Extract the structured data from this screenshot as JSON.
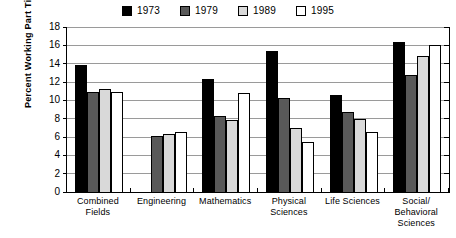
{
  "chart_data": {
    "type": "bar",
    "title": "",
    "xlabel": "",
    "ylabel": "Percent Working Part Time",
    "ylim": [
      0,
      18
    ],
    "ytick_step": 2,
    "yticks": [
      "0",
      "2",
      "4",
      "6",
      "8",
      "10",
      "12",
      "14",
      "16",
      "18"
    ],
    "grid": true,
    "legend_position": "top-center",
    "categories": [
      "Combined Fields",
      "Engineering",
      "Mathematics",
      "Physical Sciences",
      "Life Sciences",
      "Social/ Behavioral Sciences"
    ],
    "category_lines": [
      [
        "Combined",
        "Fields"
      ],
      [
        "Engineering"
      ],
      [
        "Mathematics"
      ],
      [
        "Physical",
        "Sciences"
      ],
      [
        "Life Sciences"
      ],
      [
        "Social/",
        "Behavioral",
        "Sciences"
      ]
    ],
    "series": [
      {
        "name": "1973",
        "color": "#000000",
        "values": [
          13.9,
          null,
          12.3,
          15.4,
          10.6,
          16.4
        ]
      },
      {
        "name": "1979",
        "color": "#595959",
        "values": [
          10.9,
          6.1,
          8.3,
          10.3,
          8.7,
          12.8
        ]
      },
      {
        "name": "1989",
        "color": "#d9d9d9",
        "values": [
          11.2,
          6.3,
          7.9,
          7.0,
          8.0,
          14.8
        ]
      },
      {
        "name": "1995",
        "color": "#ffffff",
        "values": [
          10.9,
          6.6,
          10.8,
          5.5,
          6.6,
          16.0
        ]
      }
    ]
  }
}
